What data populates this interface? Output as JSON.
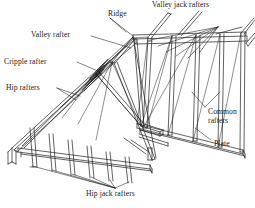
{
  "figure": {
    "kind": "roof-framing-isometric-line-drawing",
    "background_color": "#ffffff",
    "line_color": "#1f1f1f",
    "label_color": "#1a1a1a"
  },
  "labels": {
    "ridge": "Ridge",
    "valley_jack_rafters": "Valley jack rafters",
    "valley_rafter": "Valley rafter",
    "cripple_rafter": "Cripple rafter",
    "hip_rafters": "Hip rafters",
    "common_rafters": "Common\nrafters",
    "plate": "Plate",
    "hip_jack_rafters": "Hip jack rafters"
  }
}
